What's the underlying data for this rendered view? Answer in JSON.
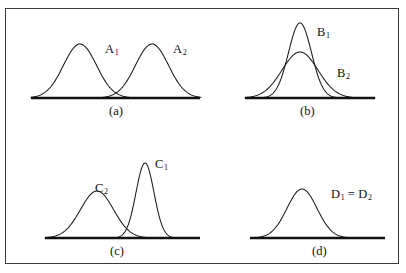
{
  "figure": {
    "border_color": "#3a3a3a",
    "curve_color": "#1a1a1a",
    "axis_color": "#111111",
    "background": "#ffffff"
  },
  "panels": [
    {
      "id": "a",
      "caption": "(a)",
      "caption_x": 109,
      "caption_y": 104,
      "baseline": {
        "x1": 31,
        "x2": 200,
        "y": 98
      },
      "labels": [
        {
          "base": "A",
          "sub": "1",
          "x": 105,
          "y": 42
        },
        {
          "base": "A",
          "sub": "2",
          "x": 173,
          "y": 42
        }
      ],
      "curves": [
        {
          "name": "A1",
          "mu": 80,
          "sigma": 16.5,
          "peak_y": 44,
          "x_start": 31,
          "x_end": 132
        },
        {
          "name": "A2",
          "mu": 152,
          "sigma": 16.5,
          "peak_y": 44,
          "x_start": 100,
          "x_end": 201
        }
      ]
    },
    {
      "id": "b",
      "caption": "(b)",
      "caption_x": 300,
      "caption_y": 104,
      "baseline": {
        "x1": 245,
        "x2": 375,
        "y": 98
      },
      "labels": [
        {
          "base": "B",
          "sub": "1",
          "x": 317,
          "y": 25
        },
        {
          "base": "B",
          "sub": "2",
          "x": 337,
          "y": 66
        }
      ],
      "curves": [
        {
          "name": "B1",
          "mu": 300,
          "sigma": 11.5,
          "peak_y": 23,
          "x_start": 258,
          "x_end": 342
        },
        {
          "name": "B2",
          "mu": 300,
          "sigma": 18.0,
          "peak_y": 52,
          "x_start": 245,
          "x_end": 375
        }
      ]
    },
    {
      "id": "c",
      "caption": "(c)",
      "caption_x": 110,
      "caption_y": 244,
      "baseline": {
        "x1": 45,
        "x2": 200,
        "y": 238
      },
      "labels": [
        {
          "base": "C",
          "sub": "2",
          "x": 95,
          "y": 181
        },
        {
          "base": "C",
          "sub": "1",
          "x": 155,
          "y": 157
        }
      ],
      "curves": [
        {
          "name": "C2",
          "mu": 97,
          "sigma": 16.5,
          "peak_y": 191,
          "x_start": 45,
          "x_end": 155
        },
        {
          "name": "C1",
          "mu": 145,
          "sigma": 9.0,
          "peak_y": 163,
          "x_start": 112,
          "x_end": 180
        }
      ]
    },
    {
      "id": "d",
      "caption": "(d)",
      "caption_x": 312,
      "caption_y": 244,
      "baseline": {
        "x1": 250,
        "x2": 385,
        "y": 238
      },
      "labels": [
        {
          "base": "D",
          "sub": "1",
          "x": 331,
          "y": 187,
          "infix": " = ",
          "base2": "D",
          "sub2": "2"
        }
      ],
      "curves": [
        {
          "name": "D1 = D2",
          "mu": 302,
          "sigma": 15.0,
          "peak_y": 189,
          "x_start": 253,
          "x_end": 352
        }
      ]
    }
  ]
}
